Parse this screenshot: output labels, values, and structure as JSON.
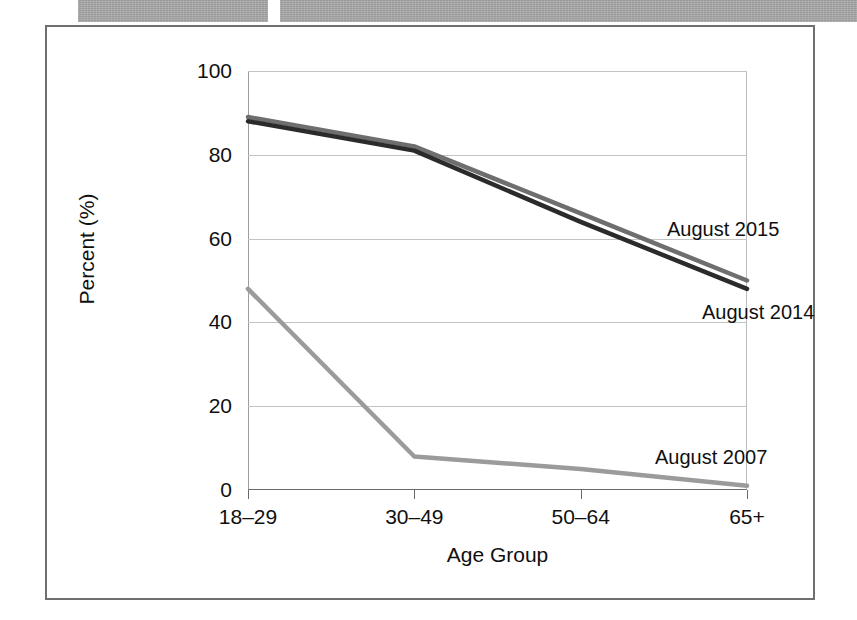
{
  "redaction": {
    "bar_1_label": "redacted-text-bar",
    "bar_2_label": "redacted-text-bar",
    "color": "#9a9a9a"
  },
  "chart_data": {
    "type": "line",
    "title": "",
    "xlabel": "Age Group",
    "ylabel": "Percent (%)",
    "categories": [
      "18–29",
      "30–49",
      "50–64",
      "65+"
    ],
    "ylim": [
      0,
      100
    ],
    "yticks": [
      0,
      20,
      40,
      60,
      80,
      100
    ],
    "ytick_labels": [
      "0",
      "20",
      "40",
      "60",
      "80",
      "100"
    ],
    "grid": true,
    "grid_axis": "y",
    "legend_position": "inline-annotations",
    "series": [
      {
        "name": "August 2015",
        "color": "#6e6e6e",
        "values": [
          89,
          82,
          66,
          50
        ]
      },
      {
        "name": "August 2014",
        "color": "#2b2b2b",
        "values": [
          88,
          81,
          64,
          48
        ]
      },
      {
        "name": "August 2007",
        "color": "#9b9b9b",
        "values": [
          48,
          8,
          5,
          1
        ]
      }
    ],
    "annotations": [
      {
        "text": "August 2015",
        "series": "August 2015"
      },
      {
        "text": "August 2014",
        "series": "August 2014"
      },
      {
        "text": "August 2007",
        "series": "August 2007"
      }
    ]
  }
}
